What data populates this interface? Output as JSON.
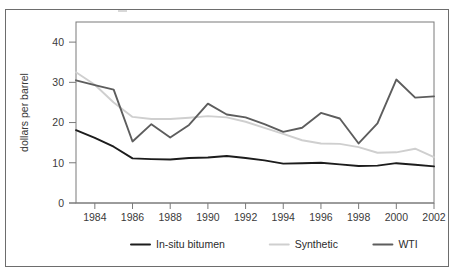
{
  "figure": {
    "border_color": "#6d6d6d",
    "background": "#ffffff"
  },
  "chart_data": {
    "type": "line",
    "title": "",
    "subtitle": "",
    "xlabel": "",
    "ylabel": "dollars per barrel",
    "x": [
      1983,
      1984,
      1985,
      1986,
      1987,
      1988,
      1989,
      1990,
      1991,
      1992,
      1993,
      1994,
      1995,
      1996,
      1997,
      1998,
      1999,
      2000,
      2001,
      2002
    ],
    "xtick_labels": [
      "1984",
      "1986",
      "1988",
      "1990",
      "1992",
      "1994",
      "1996",
      "1998",
      "2000",
      "2002"
    ],
    "xticks": [
      1984,
      1986,
      1988,
      1990,
      1992,
      1994,
      1996,
      1998,
      2000,
      2002
    ],
    "xlim": [
      1983,
      2002
    ],
    "ytick_labels": [
      "0",
      "10",
      "20",
      "30",
      "40"
    ],
    "yticks": [
      0,
      10,
      20,
      30,
      40
    ],
    "ylim": [
      0,
      45
    ],
    "grid": false,
    "legend_position": "bottom",
    "series": [
      {
        "name": "In-situ bitumen",
        "color": "#1c1c1c",
        "width": 1.9,
        "values": [
          18.1,
          16.2,
          14.0,
          11.1,
          10.9,
          10.8,
          11.2,
          11.3,
          11.7,
          11.2,
          10.6,
          9.8,
          9.9,
          10.0,
          9.6,
          9.2,
          9.3,
          9.9,
          9.5,
          9.1
        ]
      },
      {
        "name": "Synthetic",
        "color": "#cfcfcf",
        "width": 1.9,
        "values": [
          32.5,
          29.4,
          25.0,
          21.4,
          20.9,
          20.9,
          21.2,
          21.6,
          21.3,
          20.2,
          18.7,
          17.2,
          15.6,
          14.8,
          14.7,
          13.9,
          12.5,
          12.6,
          13.5,
          11.4
        ]
      },
      {
        "name": "WTI",
        "color": "#5d5d5d",
        "width": 1.9,
        "values": [
          30.5,
          29.3,
          28.2,
          15.3,
          19.6,
          16.3,
          19.4,
          24.7,
          22.0,
          21.3,
          19.6,
          17.7,
          18.7,
          22.4,
          21.0,
          14.8,
          19.8,
          30.7,
          26.2,
          26.5
        ]
      }
    ]
  },
  "legend": {
    "items": [
      {
        "label": "In-situ bitumen",
        "color": "#1c1c1c"
      },
      {
        "label": "Synthetic",
        "color": "#cfcfcf"
      },
      {
        "label": "WTI",
        "color": "#5d5d5d"
      }
    ]
  }
}
